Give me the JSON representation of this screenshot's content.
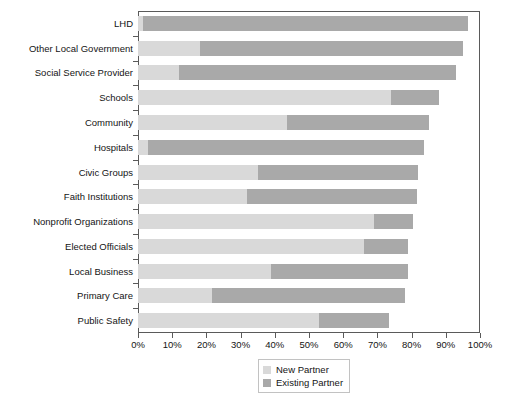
{
  "chart_data": {
    "type": "bar",
    "orientation": "horizontal",
    "stacked": true,
    "title": "",
    "subtitle": "",
    "xlabel": "",
    "ylabel": "",
    "xlim": [
      0,
      100
    ],
    "xtick_labels": [
      "0%",
      "10%",
      "20%",
      "30%",
      "40%",
      "50%",
      "60%",
      "70%",
      "80%",
      "90%",
      "100%"
    ],
    "xtick_values": [
      0,
      10,
      20,
      30,
      40,
      50,
      60,
      70,
      80,
      90,
      100
    ],
    "grid": false,
    "legend_position": "bottom-center",
    "categories": [
      "LHD",
      "Other Local Government",
      "Social Service Provider",
      "Schools",
      "Community",
      "Hospitals",
      "Civic Groups",
      "Faith Institutions",
      "Nonprofit Organizations",
      "Elected Officials",
      "Local Business",
      "Primary Care",
      "Public Safety"
    ],
    "series": [
      {
        "name": "New Partner",
        "color": "#d9d9d9",
        "values": [
          1.5,
          18,
          12,
          74,
          43.5,
          3,
          35,
          32,
          69,
          66,
          39,
          21.5,
          53
        ]
      },
      {
        "name": "Existing Partner",
        "color": "#a9a9a9",
        "values": [
          95,
          77,
          81,
          14,
          41.5,
          80.5,
          47,
          49.5,
          11.5,
          13,
          40,
          56.5,
          20.5
        ]
      }
    ],
    "totals": [
      96.5,
      95,
      93,
      88,
      85,
      83.5,
      82,
      81.5,
      80.5,
      79,
      79,
      78,
      73.5
    ]
  },
  "legend": {
    "items": [
      {
        "label": "New Partner",
        "color": "#d9d9d9"
      },
      {
        "label": "Existing Partner",
        "color": "#a9a9a9"
      }
    ]
  }
}
